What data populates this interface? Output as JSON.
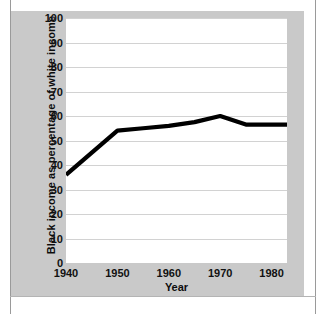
{
  "chart_data": {
    "type": "line",
    "title": "",
    "xlabel": "Year",
    "ylabel": "Black income as  percentage of white income",
    "x": [
      1940,
      1950,
      1955,
      1960,
      1965,
      1970,
      1975,
      1980,
      1983
    ],
    "values": [
      36,
      54,
      55,
      56,
      57.5,
      60,
      56.5,
      56.5,
      56.5
    ],
    "series": [
      {
        "name": "Black income as percentage of white income",
        "values": [
          36,
          54,
          55,
          56,
          57.5,
          60,
          56.5,
          56.5,
          56.5
        ]
      }
    ],
    "xlim": [
      1940,
      1983
    ],
    "ylim": [
      0,
      100
    ],
    "ytick_labels": [
      "100",
      "90",
      "80",
      "70",
      "60",
      "50",
      "40",
      "30",
      "20",
      "10",
      "0"
    ],
    "ytick_values": [
      100,
      90,
      80,
      70,
      60,
      50,
      40,
      30,
      20,
      10,
      0
    ],
    "xtick_labels": [
      "1940",
      "1950",
      "1960",
      "1970",
      "1980"
    ],
    "xtick_values": [
      1940,
      1950,
      1960,
      1970,
      1980
    ],
    "grid": "horizontal",
    "legend": "none",
    "line_color": "#000000",
    "plot_background": "#ffffff",
    "panel_background": "#c9c9c9",
    "gridline_color": "#d2d2d2"
  }
}
